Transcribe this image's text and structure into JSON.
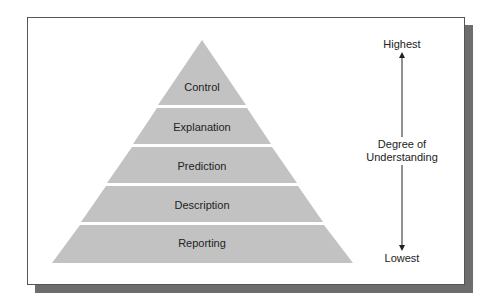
{
  "diagram": {
    "type": "pyramid",
    "levels": [
      {
        "label": "Control",
        "rank": 5
      },
      {
        "label": "Explanation",
        "rank": 4
      },
      {
        "label": "Prediction",
        "rank": 3
      },
      {
        "label": "Description",
        "rank": 2
      },
      {
        "label": "Reporting",
        "rank": 1
      }
    ],
    "axis": {
      "top_label": "Highest",
      "middle_label_line1": "Degree of",
      "middle_label_line2": "Understanding",
      "bottom_label": "Lowest"
    },
    "colors": {
      "pyramid_fill": "#c2c2c2",
      "band_separator": "#ffffff",
      "frame_border": "#555555",
      "shadow": "#6d6d6d",
      "arrow": "#222222"
    }
  }
}
